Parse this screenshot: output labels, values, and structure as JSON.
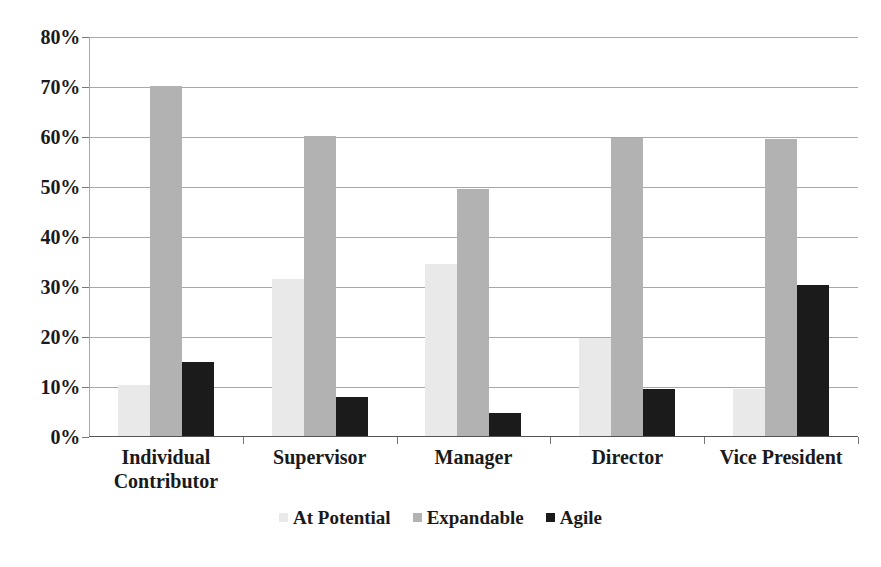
{
  "chart_data": {
    "type": "bar",
    "title": "",
    "subtitle": "",
    "xlabel": "",
    "ylabel": "",
    "grid": true,
    "legend_position": "bottom",
    "ylim": [
      0,
      80
    ],
    "y_tick_labels": [
      "80%",
      "70%",
      "60%",
      "50%",
      "40%",
      "30%",
      "20%",
      "10%",
      "0%"
    ],
    "y_tick_values": [
      80,
      70,
      60,
      50,
      40,
      30,
      20,
      10,
      0
    ],
    "categories": [
      "Individual\nContributor",
      "Supervisor",
      "Manager",
      "Director",
      "Vice President"
    ],
    "category_lines": [
      [
        "Individual",
        "Contributor"
      ],
      [
        "Supervisor"
      ],
      [
        "Manager"
      ],
      [
        "Director"
      ],
      [
        "Vice President"
      ]
    ],
    "series": [
      {
        "name": "At Potential",
        "color": "#e9e9e9",
        "values": [
          10.2,
          31.5,
          34.5,
          19.6,
          9.5
        ]
      },
      {
        "name": "Expandable",
        "color": "#b2b2b2",
        "values": [
          70.0,
          60.0,
          49.5,
          59.6,
          59.5
        ]
      },
      {
        "name": "Agile",
        "color": "#1b1b1b",
        "values": [
          14.9,
          7.9,
          4.6,
          9.5,
          30.3
        ]
      }
    ]
  },
  "colors": {
    "at_potential": "#e9e9e9",
    "expandable": "#b2b2b2",
    "agile": "#1b1b1b",
    "gridline": "#a8a8a8",
    "axis": "#555555",
    "text": "#1a1a1a",
    "background": "#ffffff"
  }
}
